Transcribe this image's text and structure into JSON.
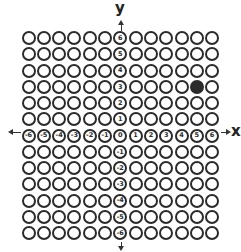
{
  "diagram": {
    "type": "coordinate-grid",
    "x_axis_label": "x",
    "y_axis_label": "y",
    "x_range": [
      -6,
      6
    ],
    "y_range": [
      -6,
      6
    ],
    "x_tick_labels": [
      "-6",
      "-5",
      "-4",
      "-3",
      "-2",
      "-1",
      "0",
      "1",
      "2",
      "3",
      "4",
      "5",
      "6"
    ],
    "y_tick_labels": [
      "6",
      "5",
      "4",
      "3",
      "2",
      "1",
      "0",
      "-1",
      "-2",
      "-3",
      "-4",
      "-5",
      "-6"
    ],
    "filled_points": [
      {
        "x": 5,
        "y": 3
      }
    ],
    "colors": {
      "ring": "#2b2b2b",
      "fill": "#2b2b2b",
      "background": "#ffffff"
    }
  }
}
